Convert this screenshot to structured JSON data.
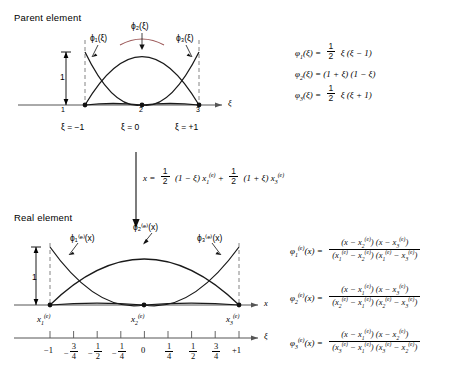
{
  "figure": {
    "parent_section_title": "Parent element",
    "real_section_title": "Real element"
  },
  "parent": {
    "axis_label_x": "ξ",
    "height_marker": "1",
    "curve_labels": [
      "ϕ₁(ξ)",
      "ϕ₂(ξ)",
      "ϕ₃(ξ)"
    ],
    "node_numbers": [
      "1",
      "2",
      "3"
    ],
    "node_coord_labels": [
      "ξ = −1",
      "ξ = 0",
      "ξ = +1"
    ],
    "shape_functions": [
      {
        "lhs": "ϕ₁(ξ) =",
        "rhs": "½ ξ (ξ − 1)"
      },
      {
        "lhs": "ϕ₂(ξ) =",
        "rhs": "(1 + ξ) (1 − ξ)"
      },
      {
        "lhs": "ϕ₃(ξ) =",
        "rhs": "½ ξ (ξ + 1)"
      }
    ]
  },
  "mapping": {
    "equation": "x = ½ (1 − ξ) x₁⁽ᵉ⁾ + ½ (1 + ξ) x₃⁽ᵉ⁾"
  },
  "real": {
    "axis_label_x": "x",
    "axis_label_xi": "ξ",
    "height_marker": "1",
    "curve_labels": [
      "ϕ₁⁽ᵉ⁾(x)",
      "ϕ₂⁽ᵉ⁾(x)",
      "ϕ₃⁽ᵉ⁾(x)"
    ],
    "node_labels": [
      "x₁⁽ᵉ⁾",
      "x₂⁽ᵉ⁾",
      "x₃⁽ᵉ⁾"
    ],
    "xi_ticks": [
      "−1",
      "−3/4",
      "−1/2",
      "−1/4",
      "0",
      "1/4",
      "1/2",
      "3/4",
      "+1"
    ],
    "xi_tick_values": [
      -1,
      -0.75,
      -0.5,
      -0.25,
      0,
      0.25,
      0.5,
      0.75,
      1
    ],
    "shape_functions": [
      {
        "lhs": "ϕ₁⁽ᵉ⁾(x) =",
        "num": "(x − x₂⁽ᵉ⁾) (x − x₃⁽ᵉ⁾)",
        "den": "(x₁⁽ᵉ⁾ − x₂⁽ᵉ⁾) (x₁⁽ᵉ⁾ − x₃⁽ᵉ⁾)"
      },
      {
        "lhs": "ϕ₂⁽ᵉ⁾(x) =",
        "num": "(x − x₁⁽ᵉ⁾) (x − x₃⁽ᵉ⁾)",
        "den": "(x₂⁽ᵉ⁾ − x₁⁽ᵉ⁾) (x₂⁽ᵉ⁾ − x₃⁽ᵉ⁾)"
      },
      {
        "lhs": "ϕ₃⁽ᵉ⁾(x) =",
        "num": "(x − x₁⁽ᵉ⁾) (x − x₂⁽ᵉ⁾)",
        "den": "(x₃⁽ᵉ⁾ − x₁⁽ᵉ⁾) (x₃⁽ᵉ⁾ − x₂⁽ᵉ⁾)"
      }
    ]
  },
  "colors": {
    "curve": "#1a1a1a",
    "accent": "#8a3a3a",
    "axis": "#555555",
    "dashed": "#777777"
  }
}
